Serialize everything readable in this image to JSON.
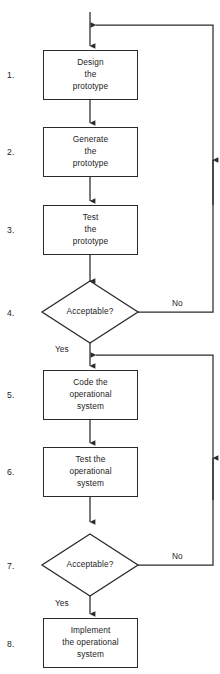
{
  "diagram": {
    "line_color": "#2b2b2b",
    "text_color": "#1c1c1c",
    "background_color": "#ffffff",
    "steps": [
      {
        "number": "1.",
        "shape": "process",
        "text_lines": [
          "Design",
          "the",
          "prototype"
        ]
      },
      {
        "number": "2.",
        "shape": "process",
        "text_lines": [
          "Generate",
          "the",
          "prototype"
        ]
      },
      {
        "number": "3.",
        "shape": "process",
        "text_lines": [
          "Test",
          "the",
          "prototype"
        ]
      },
      {
        "number": "4.",
        "shape": "decision",
        "text_lines": [
          "Acceptable?"
        ]
      },
      {
        "number": "5.",
        "shape": "process",
        "text_lines": [
          "Code the",
          "operational",
          "system"
        ]
      },
      {
        "number": "6.",
        "shape": "process",
        "text_lines": [
          "Test the",
          "operational",
          "system"
        ]
      },
      {
        "number": "7.",
        "shape": "decision",
        "text_lines": [
          "Acceptable?"
        ]
      },
      {
        "number": "8.",
        "shape": "process",
        "text_lines": [
          "Implement",
          "the operational",
          "system"
        ]
      }
    ],
    "edge_labels": {
      "decision4_no": "No",
      "decision4_yes": "Yes",
      "decision7_no": "No",
      "decision7_yes": "Yes"
    }
  }
}
